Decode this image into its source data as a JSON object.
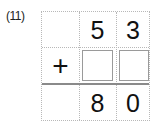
{
  "problem": {
    "label": "(11)",
    "operator": "+",
    "rows": [
      [
        "",
        "5",
        "3"
      ],
      [
        "+",
        "",
        ""
      ],
      [
        "",
        "8",
        "0"
      ]
    ],
    "top_number": {
      "tens": "5",
      "ones": "3"
    },
    "addend_blanks": {
      "tens": "",
      "ones": ""
    },
    "result": {
      "tens": "8",
      "ones": "0"
    }
  },
  "colors": {
    "grid_dotted": "#b8b8b8",
    "sum_line": "#8a8a8a",
    "answer_box_border": "#9a9a9a",
    "text": "#111111"
  }
}
